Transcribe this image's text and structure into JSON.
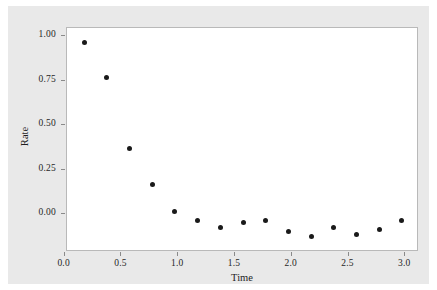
{
  "chart_data": {
    "type": "scatter",
    "title": "",
    "xlabel": "Time",
    "ylabel": "Rate",
    "xlim": [
      -0.05,
      3.05
    ],
    "ylim": [
      -0.18,
      1.08
    ],
    "grid": false,
    "legend": null,
    "marker": {
      "shape": "circle",
      "color": "#1a1a1a",
      "size": 5
    },
    "xticks": [
      "0.0",
      "0.5",
      "1.0",
      "1.5",
      "2.0",
      "2.5",
      "3.0"
    ],
    "xtick_values": [
      0.0,
      0.5,
      1.0,
      1.5,
      2.0,
      2.5,
      3.0
    ],
    "yticks": [
      "1.00",
      "0.75",
      "0.50",
      "0.25",
      "0.00"
    ],
    "ytick_values": [
      1.0,
      0.75,
      0.5,
      0.25,
      0.0
    ],
    "x": [
      0.1,
      0.3,
      0.5,
      0.7,
      0.9,
      1.1,
      1.3,
      1.5,
      1.7,
      1.9,
      2.1,
      2.3,
      2.5,
      2.7,
      2.9
    ],
    "y": [
      1.0,
      0.8,
      0.4,
      0.2,
      0.05,
      0.0,
      -0.04,
      -0.015,
      0.0,
      -0.065,
      -0.095,
      -0.04,
      -0.08,
      -0.055,
      0.0
    ],
    "points": [
      {
        "x": 0.1,
        "y": 1.0
      },
      {
        "x": 0.3,
        "y": 0.8
      },
      {
        "x": 0.5,
        "y": 0.4
      },
      {
        "x": 0.7,
        "y": 0.2
      },
      {
        "x": 0.9,
        "y": 0.05
      },
      {
        "x": 1.1,
        "y": 0.0
      },
      {
        "x": 1.3,
        "y": -0.04
      },
      {
        "x": 1.5,
        "y": -0.015
      },
      {
        "x": 1.7,
        "y": 0.0
      },
      {
        "x": 1.9,
        "y": -0.065
      },
      {
        "x": 2.1,
        "y": -0.095
      },
      {
        "x": 2.3,
        "y": -0.04
      },
      {
        "x": 2.5,
        "y": -0.08
      },
      {
        "x": 2.7,
        "y": -0.055
      },
      {
        "x": 2.9,
        "y": 0.0
      }
    ]
  },
  "colors": {
    "figure_background": "#e9e9e9",
    "axes_background": "#ffffff",
    "axes_border": "#b9b9b9",
    "marker": "#1a1a1a",
    "tick": "#8a8a8a",
    "text": "#1e1e1e"
  }
}
